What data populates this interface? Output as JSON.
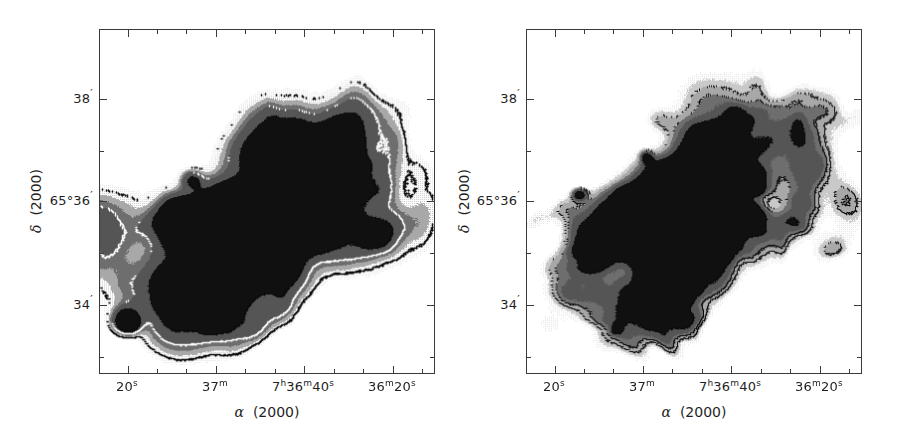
{
  "figure": {
    "kind": "two-panel astronomical grayscale contour map",
    "width": 911,
    "height": 440,
    "background": "#ffffff"
  },
  "axes": {
    "x": {
      "title_symbol": "α",
      "title_epoch": "(2000)",
      "ticks": [
        {
          "label_html": "20<sup class=\"u\">s</sup>",
          "label_text": "20s",
          "x_frac": 0.082,
          "major": true
        },
        {
          "label_html": "",
          "label_text": "",
          "x_frac": 0.1697,
          "major": false
        },
        {
          "label_html": "",
          "label_text": "",
          "x_frac": 0.2574,
          "major": false
        },
        {
          "label_html": "37<sup class=\"u\">m</sup>",
          "label_text": "37m",
          "x_frac": 0.3451,
          "major": true
        },
        {
          "label_html": "",
          "label_text": "",
          "x_frac": 0.4328,
          "major": false
        },
        {
          "label_html": "",
          "label_text": "",
          "x_frac": 0.5205,
          "major": false
        },
        {
          "label_html": "7<sup class=\"u\">h</sup>36<sup class=\"u\">m</sup>40<sup class=\"u\">s</sup>",
          "label_text": "7h36m40s",
          "x_frac": 0.6082,
          "major": true
        },
        {
          "label_html": "",
          "label_text": "",
          "x_frac": 0.6959,
          "major": false
        },
        {
          "label_html": "",
          "label_text": "",
          "x_frac": 0.7836,
          "major": false
        },
        {
          "label_html": "36<sup class=\"u\">m</sup>20<sup class=\"u\">s</sup>",
          "label_text": "36m20s",
          "x_frac": 0.8713,
          "major": true
        },
        {
          "label_html": "",
          "label_text": "",
          "x_frac": 0.959,
          "major": false
        }
      ]
    },
    "y": {
      "title_symbol": "δ",
      "title_epoch": "(2000)",
      "ticks": [
        {
          "label_html": "38<sup class=\"pm\">′</sup>",
          "label_text": "38'",
          "y_frac": 0.2,
          "major": true
        },
        {
          "label_html": "",
          "label_text": "",
          "y_frac": 0.35,
          "major": false
        },
        {
          "label_html": "65°36<sup class=\"pm\">′</sup>",
          "label_text": "65°36'",
          "y_frac": 0.4957,
          "major": true
        },
        {
          "label_html": "",
          "label_text": "",
          "y_frac": 0.646,
          "major": false
        },
        {
          "label_html": "34<sup class=\"pm\">′</sup>",
          "label_text": "34'",
          "y_frac": 0.7971,
          "major": true
        },
        {
          "label_html": "",
          "label_text": "",
          "y_frac": 0.947,
          "major": false
        }
      ]
    }
  },
  "panels": [
    {
      "id": "left",
      "name": "left-map-panel",
      "seed": 20241,
      "blob_count": 170,
      "contour_color": "#0a0a0a",
      "white_contour_color": "#ffffff"
    },
    {
      "id": "right",
      "name": "right-map-panel",
      "seed": 77113,
      "blob_count": 230,
      "contour_color": "#0a0a0a",
      "white_contour_color": "#ffffff"
    }
  ],
  "greyscale_levels": {
    "white": "#ffffff",
    "very_light": "#e2e2e2",
    "light": "#c9c9c9",
    "mid": "#a8a8a8",
    "dark": "#6e6e6e",
    "darker": "#555555",
    "black": "#101010"
  },
  "frame": {
    "border_color": "#3a3a3a",
    "tick_color": "#3a3a3a"
  }
}
